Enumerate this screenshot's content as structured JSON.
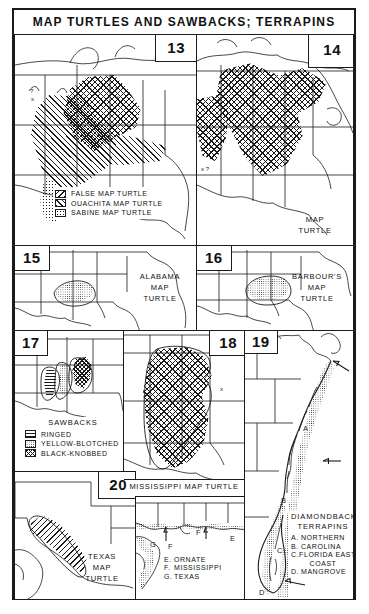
{
  "plate": {
    "title": "MAP TURTLES AND SAWBACKS; TERRAPINS"
  },
  "panels": [
    {
      "number": "13",
      "caption": "",
      "legend": {
        "heading": "",
        "items": [
          {
            "label": "FALSE MAP TURTLE",
            "pattern": "diagonal-right"
          },
          {
            "label": "OUACHITA MAP TURTLE",
            "pattern": "diagonal-left"
          },
          {
            "label": "SABINE MAP TURTLE",
            "pattern": "stipple"
          }
        ]
      }
    },
    {
      "number": "14",
      "caption_lines": [
        "MAP",
        "TURTLE"
      ],
      "legend": null
    },
    {
      "number": "15",
      "caption_lines": [
        "ALABAMA",
        "MAP",
        "TURTLE"
      ],
      "legend": null
    },
    {
      "number": "16",
      "caption_lines": [
        "BARBOUR'S",
        "MAP",
        "TURTLE"
      ],
      "legend": null
    },
    {
      "number": "17",
      "caption": "",
      "legend": {
        "heading": "SAWBACKS",
        "items": [
          {
            "label": "RINGED",
            "pattern": "horizontal-lines"
          },
          {
            "label": "YELLOW-BLOTCHED",
            "pattern": "fine-stipple"
          },
          {
            "label": "BLACK-KNOBBED",
            "pattern": "dense-crosshatch"
          }
        ]
      }
    },
    {
      "number": "18",
      "caption": "MISSISSIPPI MAP TURTLE",
      "legend": null
    },
    {
      "number": "19",
      "caption": "",
      "legend": {
        "heading_lines": [
          "DIAMONDBACK",
          "TERRAPINS"
        ],
        "items": [
          {
            "key": "A.",
            "label": "NORTHERN"
          },
          {
            "key": "B.",
            "label": "CAROLINA"
          },
          {
            "key": "C.",
            "label": "FLORIDA EAST"
          },
          {
            "key": "",
            "label": "COAST"
          },
          {
            "key": "D.",
            "label": "MANGROVE"
          }
        ]
      },
      "map_markers": [
        "A",
        "B",
        "C",
        "D"
      ]
    },
    {
      "number": "20",
      "caption_lines": [
        "TEXAS",
        "MAP",
        "TURTLE"
      ],
      "legend": null
    },
    {
      "number": "",
      "caption": "",
      "legend": {
        "items": [
          {
            "key": "E.",
            "label": "ORNATE"
          },
          {
            "key": "F.",
            "label": "MISSISSIPPI"
          },
          {
            "key": "G.",
            "label": "TEXAS"
          }
        ]
      },
      "map_markers": [
        "G",
        "F",
        "F",
        "E"
      ]
    }
  ],
  "colors": {
    "ink": "#1a1a1a",
    "paper": "#ffffff"
  }
}
